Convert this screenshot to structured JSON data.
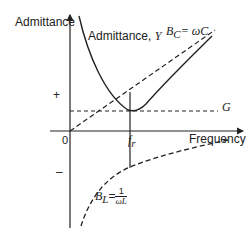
{
  "diagram": {
    "y_axis_label": "Admittance",
    "x_axis_label": "Frequency",
    "origin_label": "0",
    "plus_label": "+",
    "minus_label": "–",
    "curves": {
      "admittance": {
        "label_text": "Admittance, ",
        "label_symbol": "Y"
      },
      "capacitive": {
        "label_sym": "B",
        "label_sub": "C",
        "label_eq": "= ωC"
      },
      "conductance": {
        "label": "G"
      },
      "inductive": {
        "label_sym": "B",
        "label_sub": "L",
        "label_eq": "=",
        "frac_num": "1",
        "frac_den": "ωL"
      }
    },
    "resonance": {
      "label_sym": "f",
      "label_sub": "r"
    },
    "colors": {
      "line": "#222222",
      "background": "#ffffff"
    }
  }
}
